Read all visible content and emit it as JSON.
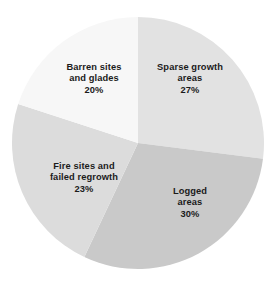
{
  "chart_data": {
    "type": "pie",
    "title": "",
    "subtitle": "",
    "xlabel": "",
    "ylabel": "",
    "legend_position": "none",
    "grid": false,
    "start_angle_deg": 0,
    "direction": "clockwise",
    "units": "percent",
    "categories": [
      "Sparse growth areas",
      "Logged areas",
      "Fire sites and failed regrowth",
      "Barren sites and glades"
    ],
    "values": [
      27,
      30,
      23,
      20
    ],
    "colors": [
      "#e2e2e2",
      "#c9c9c9",
      "#dcdcdc",
      "#f7f7f7"
    ],
    "slices": [
      {
        "name": "sparse-growth-areas",
        "label_lines": [
          "Sparse growth",
          "areas"
        ],
        "value": 27,
        "percent_text": "27%",
        "color": "#e2e2e2",
        "start_deg": 0,
        "end_deg": 97.2
      },
      {
        "name": "logged-areas",
        "label_lines": [
          "Logged",
          "areas"
        ],
        "value": 30,
        "percent_text": "30%",
        "color": "#c9c9c9",
        "start_deg": 97.2,
        "end_deg": 205.2
      },
      {
        "name": "fire-sites-and-failed-regrowth",
        "label_lines": [
          "Fire sites and",
          "failed regrowth"
        ],
        "value": 23,
        "percent_text": "23%",
        "color": "#dcdcdc",
        "start_deg": 205.2,
        "end_deg": 288.0
      },
      {
        "name": "barren-sites-and-glades",
        "label_lines": [
          "Barren sites",
          "and glades"
        ],
        "value": 20,
        "percent_text": "20%",
        "color": "#f7f7f7",
        "start_deg": 288.0,
        "end_deg": 360.0
      }
    ],
    "geometry": {
      "center_x": 138,
      "center_y": 143,
      "radius": 126
    },
    "background_color": "#ffffff",
    "label_color": "#1b1b1b"
  }
}
